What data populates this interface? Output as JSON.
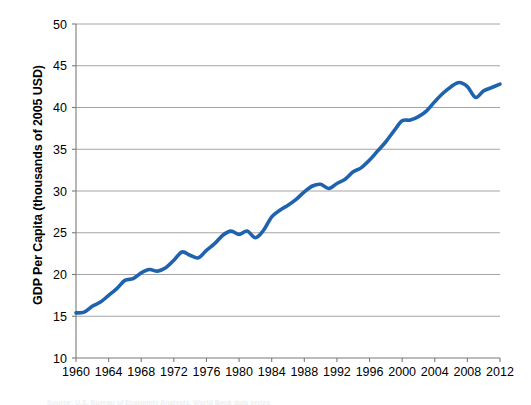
{
  "chart_data": {
    "type": "line",
    "title": "",
    "xlabel": "",
    "ylabel": "GDP Per Capita (thousands of 2005 USD)",
    "xlim": [
      1960,
      2012
    ],
    "ylim": [
      10,
      50
    ],
    "yticks": [
      10,
      15,
      20,
      25,
      30,
      35,
      40,
      45,
      50
    ],
    "xticks": [
      1960,
      1964,
      1968,
      1972,
      1976,
      1980,
      1984,
      1988,
      1992,
      1996,
      2000,
      2004,
      2008,
      2012
    ],
    "grid": "horizontal",
    "legend": "none",
    "series": [
      {
        "name": "GDP Per Capita",
        "color": "#1f63ae",
        "line_width": 3.6,
        "x": [
          1960,
          1961,
          1962,
          1963,
          1964,
          1965,
          1966,
          1967,
          1968,
          1969,
          1970,
          1971,
          1972,
          1973,
          1974,
          1975,
          1976,
          1977,
          1978,
          1979,
          1980,
          1981,
          1982,
          1983,
          1984,
          1985,
          1986,
          1987,
          1988,
          1989,
          1990,
          1991,
          1992,
          1993,
          1994,
          1995,
          1996,
          1997,
          1998,
          1999,
          2000,
          2001,
          2002,
          2003,
          2004,
          2005,
          2006,
          2007,
          2008,
          2009,
          2010,
          2011,
          2012
        ],
        "values": [
          15.4,
          15.5,
          16.2,
          16.7,
          17.5,
          18.3,
          19.3,
          19.5,
          20.2,
          20.6,
          20.4,
          20.8,
          21.7,
          22.7,
          22.3,
          22.0,
          22.9,
          23.7,
          24.7,
          25.2,
          24.8,
          25.2,
          24.4,
          25.3,
          26.9,
          27.7,
          28.3,
          29.0,
          29.9,
          30.6,
          30.8,
          30.3,
          30.9,
          31.4,
          32.3,
          32.8,
          33.7,
          34.8,
          35.9,
          37.2,
          38.4,
          38.5,
          38.9,
          39.6,
          40.7,
          41.7,
          42.5,
          43.0,
          42.5,
          41.2,
          42.0,
          42.4,
          42.8
        ]
      }
    ]
  },
  "caption": {
    "text": "Source: U.S. Bureau of Economic Analysis, World Bank data series"
  }
}
